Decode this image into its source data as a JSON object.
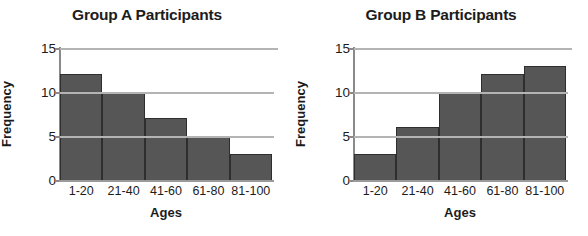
{
  "chart_data": [
    {
      "type": "bar",
      "title": "Group A Participants",
      "xlabel": "Ages",
      "ylabel": "Frequency",
      "categories": [
        "1-20",
        "21-40",
        "41-60",
        "61-80",
        "81-100"
      ],
      "values": [
        12,
        10,
        7,
        5,
        3
      ],
      "yticks": [
        0,
        5,
        10,
        15
      ],
      "ylim": [
        0,
        15
      ],
      "grid": true,
      "legend": "none",
      "bar_color": "#565656",
      "bar_edge_color": "#2e2e2e",
      "grid_color": "#b4b4b4",
      "axis_color": "#8a8a8a"
    },
    {
      "type": "bar",
      "title": "Group B Participants",
      "xlabel": "Ages",
      "ylabel": "Frequency",
      "categories": [
        "1-20",
        "21-40",
        "41-60",
        "61-80",
        "81-100"
      ],
      "values": [
        3,
        6,
        10,
        12,
        13
      ],
      "yticks": [
        0,
        5,
        10,
        15
      ],
      "ylim": [
        0,
        15
      ],
      "grid": true,
      "legend": "none",
      "bar_color": "#565656",
      "bar_edge_color": "#2e2e2e",
      "grid_color": "#b4b4b4",
      "axis_color": "#8a8a8a"
    }
  ]
}
